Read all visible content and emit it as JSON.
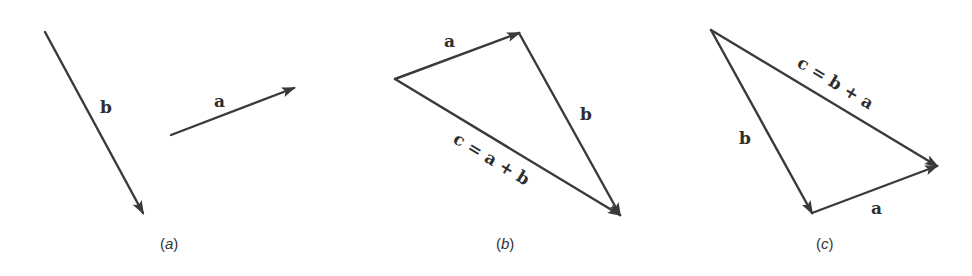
{
  "figure": {
    "panels": [
      {
        "id": "a",
        "caption_letter": "a",
        "vectors": [
          {
            "name": "b",
            "label": "b",
            "from": [
              45,
              32
            ],
            "to": [
              143,
              213
            ]
          },
          {
            "name": "a",
            "label": "a",
            "from": [
              171,
              135
            ],
            "to": [
              294,
              88
            ]
          }
        ]
      },
      {
        "id": "b",
        "caption_letter": "b",
        "vectors": [
          {
            "name": "a",
            "label": "a",
            "from": [
              395,
              79
            ],
            "to": [
              519,
              33
            ]
          },
          {
            "name": "b",
            "label": "b",
            "from": [
              519,
              33
            ],
            "to": [
              620,
              215
            ]
          },
          {
            "name": "c",
            "label": "c = a + b",
            "from": [
              395,
              79
            ],
            "to": [
              620,
              215
            ]
          }
        ]
      },
      {
        "id": "c",
        "caption_letter": "c",
        "vectors": [
          {
            "name": "b",
            "label": "b",
            "from": [
              711,
              30
            ],
            "to": [
              812,
              213
            ]
          },
          {
            "name": "a",
            "label": "a",
            "from": [
              812,
              213
            ],
            "to": [
              937,
              166
            ]
          },
          {
            "name": "c",
            "label": "c = b + a",
            "from": [
              711,
              30
            ],
            "to": [
              937,
              166
            ]
          }
        ]
      }
    ],
    "colors": {
      "stroke": "#3a3a3a",
      "text": "#2e2e2e",
      "background": "#ffffff"
    },
    "paren_open": "(",
    "paren_close": ")"
  }
}
